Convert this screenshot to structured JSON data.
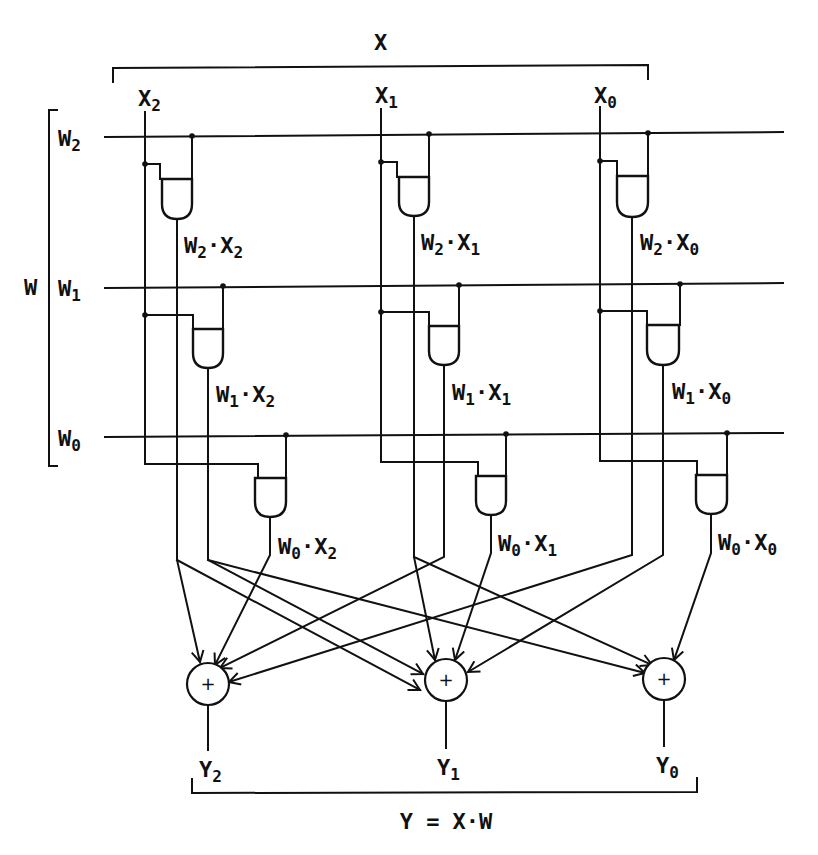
{
  "figure": {
    "type": "digital-logic-diagram"
  },
  "inputs": {
    "x_bus_label": "X",
    "x_lines": [
      {
        "name": "X",
        "sub": "2"
      },
      {
        "name": "X",
        "sub": "1"
      },
      {
        "name": "X",
        "sub": "0"
      }
    ],
    "w_bus_label": "W",
    "w_lines": [
      {
        "name": "W",
        "sub": "2"
      },
      {
        "name": "W",
        "sub": "1"
      },
      {
        "name": "W",
        "sub": "0"
      }
    ]
  },
  "gates": [
    {
      "w": "2",
      "x": "2",
      "label_w": "W",
      "label_x": "X",
      "op": "·"
    },
    {
      "w": "2",
      "x": "1",
      "label_w": "W",
      "label_x": "X",
      "op": "·"
    },
    {
      "w": "2",
      "x": "0",
      "label_w": "W",
      "label_x": "X",
      "op": "·"
    },
    {
      "w": "1",
      "x": "2",
      "label_w": "W",
      "label_x": "X",
      "op": "·"
    },
    {
      "w": "1",
      "x": "1",
      "label_w": "W",
      "label_x": "X",
      "op": "·"
    },
    {
      "w": "1",
      "x": "0",
      "label_w": "W",
      "label_x": "X",
      "op": "·"
    },
    {
      "w": "0",
      "x": "2",
      "label_w": "W",
      "label_x": "X",
      "op": "·"
    },
    {
      "w": "0",
      "x": "1",
      "label_w": "W",
      "label_x": "X",
      "op": "·"
    },
    {
      "w": "0",
      "x": "0",
      "label_w": "W",
      "label_x": "X",
      "op": "·"
    }
  ],
  "adders": [
    {
      "symbol": "+",
      "output": "Y",
      "sub": "2"
    },
    {
      "symbol": "+",
      "output": "Y",
      "sub": "1"
    },
    {
      "symbol": "+",
      "output": "Y",
      "sub": "0"
    }
  ],
  "equation": "Y = X·W",
  "colors": {
    "ink": "#111111",
    "background": "#ffffff"
  }
}
